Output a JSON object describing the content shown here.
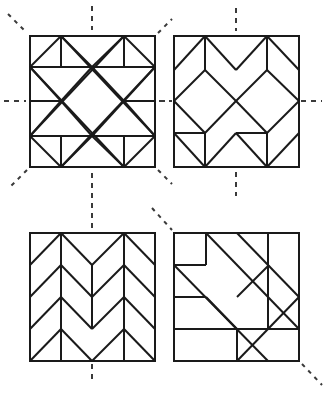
{
  "figure": {
    "background_color": "#ffffff",
    "line_color": "#1a1a1a",
    "axis_color": "#3a3a3a",
    "canvas": {
      "width": 330,
      "height": 393
    }
  },
  "blocks": [
    {
      "id": "block-1",
      "name": "top-left-block",
      "label": "Star and diamond block",
      "position": "top-left",
      "frame": {
        "x": 30,
        "y": 36,
        "width": 125,
        "height": 131
      },
      "grid": 4,
      "symmetry_axes": [
        "vertical",
        "horizontal",
        "diagonal-main",
        "diagonal-anti"
      ],
      "axis_count": 4
    },
    {
      "id": "block-2",
      "name": "top-right-block",
      "label": "Central diamond and chevron block",
      "position": "top-right",
      "frame": {
        "x": 174,
        "y": 36,
        "width": 125,
        "height": 131
      },
      "grid": 4,
      "symmetry_axes": [
        "vertical",
        "horizontal"
      ],
      "axis_count": 2
    },
    {
      "id": "block-3",
      "name": "bottom-left-block",
      "label": "Chevron herringbone block",
      "position": "bottom-left",
      "frame": {
        "x": 30,
        "y": 233,
        "width": 125,
        "height": 128
      },
      "grid": 4,
      "symmetry_axes": [
        "vertical"
      ],
      "axis_count": 1
    },
    {
      "id": "block-4",
      "name": "bottom-right-block",
      "label": "Diagonal band block",
      "position": "bottom-right",
      "frame": {
        "x": 174,
        "y": 233,
        "width": 125,
        "height": 128
      },
      "grid": 4,
      "symmetry_axes": [
        "diagonal-anti"
      ],
      "axis_count": 1
    }
  ],
  "axes": {
    "block1": [
      {
        "name": "vertical-axis-top",
        "kind": "vertical",
        "x1": 92,
        "y1": 6,
        "x2": 92,
        "y2": 30
      },
      {
        "name": "vertical-axis-bottom",
        "kind": "vertical",
        "x1": 92,
        "y1": 173,
        "x2": 92,
        "y2": 199
      },
      {
        "name": "horizontal-axis-left",
        "kind": "horizontal",
        "x1": 4,
        "y1": 101,
        "x2": 26,
        "y2": 101
      },
      {
        "name": "horizontal-axis-right",
        "kind": "horizontal",
        "x1": 159,
        "y1": 101,
        "x2": 172,
        "y2": 101
      },
      {
        "name": "diagonal-axis-top-left",
        "kind": "diagonal",
        "x1": 8,
        "y1": 14,
        "x2": 27,
        "y2": 33
      },
      {
        "name": "diagonal-axis-top-right",
        "kind": "diagonal",
        "x1": 158,
        "y1": 33,
        "x2": 172,
        "y2": 19
      },
      {
        "name": "diagonal-axis-bottom-left",
        "kind": "diagonal",
        "x1": 27,
        "y1": 170,
        "x2": 10,
        "y2": 187
      },
      {
        "name": "diagonal-axis-bottom-right",
        "kind": "diagonal",
        "x1": 158,
        "y1": 170,
        "x2": 172,
        "y2": 184
      }
    ],
    "block2": [
      {
        "name": "vertical-axis-top",
        "kind": "vertical",
        "x1": 236,
        "y1": 8,
        "x2": 236,
        "y2": 31
      },
      {
        "name": "vertical-axis-bottom",
        "kind": "vertical",
        "x1": 236,
        "y1": 172,
        "x2": 236,
        "y2": 196
      },
      {
        "name": "horizontal-axis-left",
        "kind": "horizontal",
        "x1": 160,
        "y1": 101,
        "x2": 172,
        "y2": 101
      },
      {
        "name": "horizontal-axis-right",
        "kind": "horizontal",
        "x1": 301,
        "y1": 101,
        "x2": 322,
        "y2": 101
      }
    ],
    "block3": [
      {
        "name": "vertical-axis-top",
        "kind": "vertical",
        "x1": 92,
        "y1": 203,
        "x2": 92,
        "y2": 230
      },
      {
        "name": "vertical-axis-bottom",
        "kind": "vertical",
        "x1": 92,
        "y1": 364,
        "x2": 92,
        "y2": 381
      }
    ],
    "block4": [
      {
        "name": "diagonal-axis-top-left",
        "kind": "diagonal",
        "x1": 152,
        "y1": 208,
        "x2": 172,
        "y2": 230
      },
      {
        "name": "diagonal-axis-bottom-right",
        "kind": "diagonal",
        "x1": 302,
        "y1": 364,
        "x2": 322,
        "y2": 385
      }
    ]
  },
  "pattern_lines": {
    "block1": [
      "M 30 67 L 155 67",
      "M 30 136 L 155 136",
      "M 61 36 L 61 67",
      "M 124 36 L 124 67",
      "M 61 136 L 61 167",
      "M 124 136 L 124 167",
      "M 61 36 L 30 67",
      "M 61 36 L 92 67",
      "M 124 36 L 92 67",
      "M 124 36 L 155 67",
      "M 61 167 L 30 136",
      "M 61 167 L 92 136",
      "M 124 167 L 92 136",
      "M 124 167 L 155 136",
      "M 30 67 L 61 101",
      "M 61 101 L 30 136",
      "M 155 67 L 124 101",
      "M 124 101 L 155 136",
      "M 92 67 L 61 101",
      "M 61 101 L 92 136",
      "M 92 136 L 124 101",
      "M 124 101 L 92 67",
      "M 30 101 L 61 101",
      "M 124 101 L 155 101",
      "M 61 36 L 155 136",
      "M 124 36 L 30 136",
      "M 61 167 L 155 67",
      "M 124 167 L 30 67"
    ],
    "block2": [
      "M 205 36 L 174 70",
      "M 205 36 L 236 70",
      "M 267 36 L 236 70",
      "M 267 36 L 299 70",
      "M 205 36 L 205 70",
      "M 267 36 L 267 70",
      "M 174 70 L 174 101",
      "M 299 70 L 299 101",
      "M 205 70 L 174 101",
      "M 205 70 L 236 101",
      "M 267 70 L 236 101",
      "M 267 70 L 299 101",
      "M 174 101 L 205 133",
      "M 236 101 L 205 133",
      "M 236 101 L 267 133",
      "M 299 101 L 267 133",
      "M 205 133 L 205 167",
      "M 267 133 L 267 167",
      "M 205 133 L 174 133",
      "M 267 133 L 236 133",
      "M 174 133 L 174 167",
      "M 205 167 L 174 133",
      "M 205 167 L 236 133",
      "M 267 167 L 236 133",
      "M 267 167 L 299 133",
      "M 299 133 L 299 167"
    ],
    "block3": [
      "M 30 265 L 61 233",
      "M 61 233 L 92 265",
      "M 92 265 L 124 233",
      "M 124 233 L 155 265",
      "M 61 233 L 61 265",
      "M 124 233 L 124 265",
      "M 92 265 L 92 297",
      "M 30 297 L 61 265",
      "M 61 265 L 92 297",
      "M 92 297 L 124 265",
      "M 124 265 L 155 297",
      "M 61 265 L 61 297",
      "M 124 265 L 124 297",
      "M 30 329 L 61 297",
      "M 61 297 L 92 329",
      "M 92 329 L 124 297",
      "M 124 297 L 155 329",
      "M 61 297 L 61 329",
      "M 124 297 L 124 329",
      "M 92 297 L 92 329",
      "M 30 361 L 61 329",
      "M 61 329 L 92 361",
      "M 92 361 L 124 329",
      "M 124 329 L 155 361",
      "M 61 329 L 61 361",
      "M 124 329 L 124 361",
      "M 30 265 L 30 297",
      "M 30 297 L 30 329",
      "M 155 265 L 155 297",
      "M 155 297 L 155 329"
    ],
    "block4": [
      "M 174 265 L 206 265",
      "M 206 233 L 206 265",
      "M 206 233 L 299 329",
      "M 174 265 L 268 361",
      "M 237 233 L 299 297",
      "M 237 297 L 269 265",
      "M 174 297 L 206 297",
      "M 206 297 L 237 329",
      "M 174 329 L 237 329",
      "M 237 329 L 237 361",
      "M 237 329 L 299 329",
      "M 268 233 L 268 297",
      "M 268 297 L 268 329",
      "M 237 361 L 299 297",
      "M 299 297 L 299 329"
    ]
  }
}
